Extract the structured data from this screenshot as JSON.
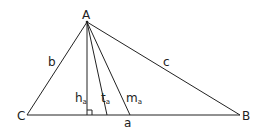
{
  "diagram": {
    "type": "triangle-cevians",
    "stroke_color": "#222222",
    "background": "#ffffff",
    "vertices": {
      "A": {
        "label": "A",
        "x": 87,
        "y": 22
      },
      "B": {
        "label": "B",
        "x": 240,
        "y": 115
      },
      "C": {
        "label": "C",
        "x": 27,
        "y": 115
      }
    },
    "sides": {
      "a": {
        "label": "a"
      },
      "b": {
        "label": "b"
      },
      "c": {
        "label": "c"
      }
    },
    "cevians": {
      "altitude": {
        "label": "h",
        "subscript": "a",
        "foot_x": 87
      },
      "bisector": {
        "label": "t",
        "subscript": "a",
        "foot_x": 107
      },
      "median": {
        "label": "m",
        "subscript": "a",
        "foot_x": 130
      }
    },
    "right_angle_marker": {
      "at_x": 87,
      "size": 5
    }
  }
}
